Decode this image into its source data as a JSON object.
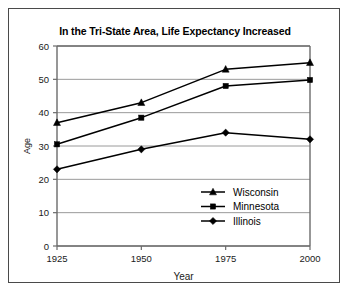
{
  "chart_data": {
    "type": "line",
    "title": "In the Tri-State Area, Life Expectancy Increased",
    "xlabel": "Year",
    "ylabel": "Age",
    "categories": [
      "1925",
      "1950",
      "1975",
      "2000"
    ],
    "x": [
      1925,
      1950,
      1975,
      2000
    ],
    "xlim": [
      1925,
      2000
    ],
    "ylim": [
      0,
      60
    ],
    "yticks": [
      0,
      10,
      20,
      30,
      40,
      50,
      60
    ],
    "ytick_labels": [
      "0",
      "10",
      "20",
      "30",
      "40",
      "50",
      "60"
    ],
    "xtick_labels": [
      "1925",
      "1950",
      "1975",
      "2000"
    ],
    "grid": "horizontal",
    "legend_position": "inside-lower-right",
    "series": [
      {
        "name": "Wisconsin",
        "marker": "triangle",
        "color": "#000000",
        "values": [
          37,
          43,
          53,
          55
        ]
      },
      {
        "name": "Minnesota",
        "marker": "square",
        "color": "#000000",
        "values": [
          30.5,
          38.5,
          48,
          49.8
        ]
      },
      {
        "name": "Illinois",
        "marker": "diamond",
        "color": "#000000",
        "values": [
          23,
          29,
          34,
          32
        ]
      }
    ]
  },
  "legend": {
    "items": [
      {
        "label": "Wisconsin",
        "marker": "triangle-marker-icon"
      },
      {
        "label": "Minnesota",
        "marker": "square-marker-icon"
      },
      {
        "label": "Illinois",
        "marker": "diamond-marker-icon"
      }
    ]
  },
  "colors": {
    "frame": "#4a4a4a",
    "gridline": "#9a9a9a",
    "axis": "#6b6b6b",
    "series": "#000000",
    "text": "#000000",
    "background": "#ffffff"
  }
}
